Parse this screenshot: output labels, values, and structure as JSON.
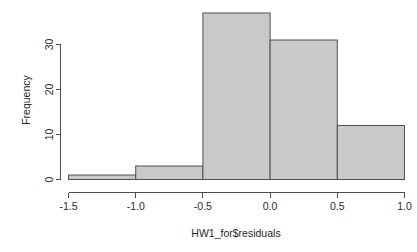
{
  "chart_data": {
    "type": "bar",
    "title": "",
    "subtitle": "",
    "xlabel": "HW1_for$residuals",
    "ylabel": "Frequency",
    "categories": [
      "-1.5 to -1.0",
      "-1.0 to -0.5",
      "-0.5 to 0.0",
      "0.0 to 0.5",
      "0.5 to 1.0"
    ],
    "values": [
      1,
      3,
      37,
      31,
      12
    ],
    "bin_edges": [
      -1.5,
      -1.0,
      -0.5,
      0.0,
      0.5,
      1.0
    ],
    "bin_width": 0.5,
    "xlim": [
      -1.5,
      1.0
    ],
    "ylim": [
      0,
      37
    ],
    "x_ticks": [
      -1.5,
      -1.0,
      -0.5,
      0.0,
      0.5,
      1.0
    ],
    "x_tick_labels": [
      "-1.5",
      "-1.0",
      "-0.5",
      "0.0",
      "0.5",
      "1.0"
    ],
    "y_ticks": [
      0,
      10,
      20,
      30
    ],
    "y_tick_labels": [
      "0",
      "10",
      "20",
      "30"
    ],
    "grid": false,
    "legend": false,
    "legend_position": "none",
    "bar_fill_color": "#c9c9c9",
    "bar_border_color": "#515151",
    "axis_color": "#4d4d4d",
    "background_color": "#ffffff",
    "y_tick_label_rotation": -90
  },
  "axes": {
    "x_axis_name": "x-axis",
    "y_axis_name": "y-axis"
  }
}
